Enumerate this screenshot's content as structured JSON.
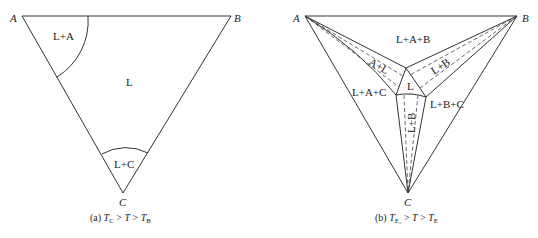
{
  "panels": [
    {
      "id": "a",
      "vertices": {
        "A": "A",
        "B": "B",
        "C": "C"
      },
      "regions": {
        "l_plus_a": "L+A",
        "l": "L",
        "l_plus_c": "L+C"
      },
      "caption": {
        "prefix": "(a) ",
        "t1": "T",
        "t1_sub": "C",
        "gt1": " > ",
        "t2": "T",
        "gt2": " > ",
        "t3": "T",
        "t3_sub": "B"
      }
    },
    {
      "id": "b",
      "vertices": {
        "A": "A",
        "B": "B",
        "C": "C"
      },
      "regions": {
        "l_plus_a_plus_b": "L+A+B",
        "a_plus_l": "A+L",
        "l_plus_b": "L+B",
        "l": "L",
        "l_plus_a_plus_c": "L+A+C",
        "l_plus_b_plus_c": "L+B+C",
        "vertical": "L+B"
      },
      "caption": {
        "prefix": "(b) ",
        "t1": "T",
        "t1_sub": "E₂",
        "gt1": " > ",
        "t2": "T",
        "gt2": " > ",
        "t3": "T",
        "t3_sub": "E"
      }
    }
  ]
}
